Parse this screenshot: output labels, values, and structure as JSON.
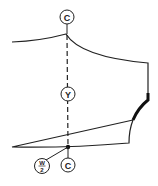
{
  "diagram": {
    "type": "sewing-pattern-piece",
    "colors": {
      "stroke": "#222222",
      "background": "#ffffff"
    },
    "labels": {
      "top_center": "C",
      "middle": "Y",
      "bottom_center": "C",
      "width_numerator": "W",
      "width_denominator": "2"
    }
  }
}
